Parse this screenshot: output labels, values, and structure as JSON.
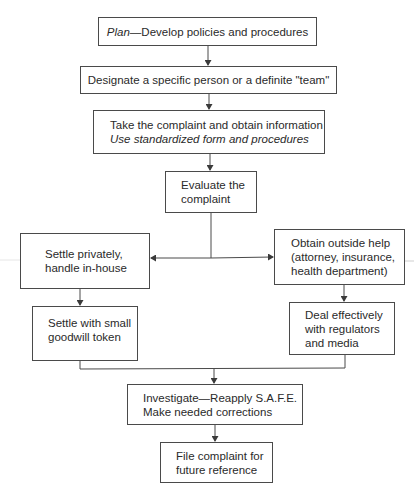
{
  "diagram": {
    "type": "flowchart",
    "nodes": {
      "plan": {
        "emphasis": "Plan",
        "separator": "—",
        "text": "Develop policies and procedures"
      },
      "designate": {
        "text": "Designate a specific person or a definite \"team\""
      },
      "take": {
        "line1": "Take the complaint and obtain information",
        "line2": "Use standardized form and procedures"
      },
      "evaluate": {
        "line1": "Evaluate the",
        "line2": "complaint"
      },
      "settle_private": {
        "line1": "Settle privately,",
        "line2": "handle in-house"
      },
      "outside_help": {
        "line1": "Obtain outside help",
        "line2": "(attorney, insurance,",
        "line3": "health department)"
      },
      "settle_small": {
        "line1": "Settle with small",
        "line2": "goodwill token"
      },
      "deal": {
        "line1": "Deal effectively",
        "line2": "with regulators",
        "line3": "and media"
      },
      "investigate": {
        "line1": "Investigate—Reapply S.A.F.E.",
        "line2": "Make needed corrections"
      },
      "file": {
        "line1": "File complaint for",
        "line2": "future reference"
      }
    },
    "edges": [
      [
        "plan",
        "designate"
      ],
      [
        "designate",
        "take"
      ],
      [
        "take",
        "evaluate"
      ],
      [
        "evaluate",
        "settle_private"
      ],
      [
        "evaluate",
        "outside_help"
      ],
      [
        "settle_private",
        "settle_small"
      ],
      [
        "outside_help",
        "deal"
      ],
      [
        "settle_small",
        "investigate"
      ],
      [
        "deal",
        "investigate"
      ],
      [
        "investigate",
        "file"
      ]
    ],
    "colors": {
      "line": "#4a4a4a",
      "text": "#2a2a2a",
      "background": "#ffffff"
    }
  }
}
